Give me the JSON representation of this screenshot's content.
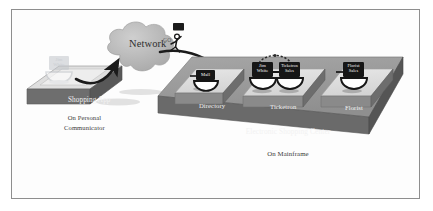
{
  "figure": {
    "border_color": "#8e8e8e",
    "background_color": "#fdfdfd"
  },
  "client": {
    "platform_label": "Shopping App",
    "caption_line1": "On Personal",
    "caption_line2": "Communicator",
    "agent_icon": {
      "name": "jim-white-agent-ghost",
      "line1": "Jim",
      "line2": "White",
      "state": "ghosted"
    }
  },
  "network": {
    "label": "Network",
    "cloud_color": "#b6b6b6",
    "shape": "cloud"
  },
  "traveler": {
    "label": "GO",
    "figure": "running-stick-figure-with-monitor"
  },
  "mainframe": {
    "platform_label": "Electronic Shopping Center",
    "caption": "On Mainframe",
    "platform_top_color": "#9a9a9a",
    "platform_side_color": "#6f6f6f",
    "blocks": [
      {
        "id": "directory",
        "label": "Directory",
        "icons": [
          {
            "name": "mall-agent",
            "line1": "Mall",
            "line2": ""
          }
        ]
      },
      {
        "id": "ticketron",
        "label": "Ticketron",
        "linked": true,
        "icons": [
          {
            "name": "jim-white-agent",
            "line1": "Jim",
            "line2": "White"
          },
          {
            "name": "ticketron-sales-agent",
            "line1": "Ticketron",
            "line2": "Sales"
          }
        ]
      },
      {
        "id": "florist",
        "label": "Florist",
        "icons": [
          {
            "name": "florist-sales-agent",
            "line1": "Florist",
            "line2": "Sales"
          }
        ]
      }
    ]
  },
  "connections": [
    {
      "name": "device-to-network",
      "from": "shopping-app",
      "to": "network"
    },
    {
      "name": "network-to-ticketron",
      "from": "network",
      "to": "jim-white-agent"
    },
    {
      "name": "agent-handshake",
      "from": "jim-white-agent",
      "to": "ticketron-sales-agent",
      "style": "dashed-arc"
    }
  ]
}
